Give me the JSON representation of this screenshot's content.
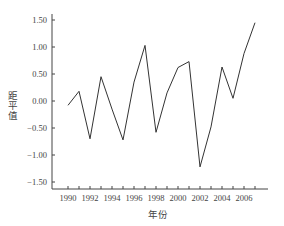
{
  "chart_data": {
    "type": "line",
    "title": "",
    "xlabel": "年份",
    "ylabel": "距平值",
    "x": [
      1990,
      1991,
      1992,
      1993,
      1994,
      1995,
      1996,
      1997,
      1998,
      1999,
      2000,
      2001,
      2002,
      2003,
      2004,
      2005,
      2006,
      2007
    ],
    "series": [
      {
        "name": "距平值",
        "values": [
          -0.08,
          0.18,
          -0.7,
          0.45,
          -0.15,
          -0.72,
          0.35,
          1.03,
          -0.58,
          0.15,
          0.62,
          0.73,
          -1.22,
          -0.48,
          0.63,
          0.05,
          0.88,
          1.45
        ],
        "color": "#333333"
      }
    ],
    "ylim": [
      -1.6,
      1.55
    ],
    "yticks": [
      1.5,
      1.0,
      0.5,
      0.0,
      -0.5,
      -1.0,
      -1.5
    ],
    "ytick_labels": [
      "1.50",
      "1.00",
      "0.50",
      "0.00",
      "−0.50",
      "−1.00",
      "−1.50"
    ],
    "xticks_labeled": [
      1990,
      1992,
      1994,
      1996,
      1998,
      2000,
      2002,
      2004,
      2006
    ],
    "xtick_labels": [
      "1990",
      "1992",
      "1994",
      "1996",
      "1998",
      "2000",
      "2002",
      "2004",
      "2006"
    ],
    "grid": false,
    "legend": "none"
  }
}
